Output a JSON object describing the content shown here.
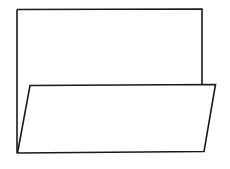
{
  "figure": {
    "colors": {
      "background": "#ffffff",
      "stroke": "#1a1a1a"
    },
    "stroke_width": 1.6,
    "back_panel": {
      "points": "17,9.5 202,9 202,84.5"
    },
    "back_left_edge": {
      "points": "17,9.5 17,153"
    },
    "front_flap": {
      "points": "30,85.5 215.5,84.5 204,151.5 17.5,153"
    }
  }
}
